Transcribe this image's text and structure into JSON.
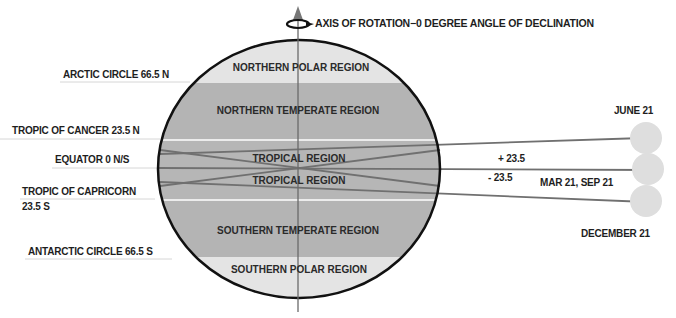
{
  "title": "AXIS OF ROTATION−0 DEGREE ANGLE OF DECLINATION",
  "icons": {
    "rotation": "rotation-arrow-icon"
  },
  "latitude_labels": {
    "arctic": "ARCTIC CIRCLE 66.5 N",
    "cancer": "TROPIC OF CANCER 23.5 N",
    "equator": "EQUATOR 0 N/S",
    "capricorn_line1": "TROPIC OF CAPRICORN",
    "capricorn_line2": "23.5  S",
    "antarctic": "ANTARCTIC CIRCLE 66.5 S"
  },
  "regions": {
    "northern_polar": "NORTHERN POLAR REGION",
    "northern_temperate": "NORTHERN TEMPERATE REGION",
    "tropical_north": "TROPICAL REGION",
    "tropical_south": "TROPICAL REGION",
    "southern_temperate": "SOUTHERN TEMPERATE REGION",
    "southern_polar": "SOUTHERN POLAR REGION"
  },
  "sun_positions": {
    "june": "JUNE 21",
    "equinox": "MAR 21, SEP 21",
    "december": "DECEMBER 21"
  },
  "angles": {
    "plus": "+ 23.5",
    "minus": "- 23.5"
  },
  "colors": {
    "polar": "#e4e4e4",
    "temperate": "#b4b4b4",
    "tropical": "#b4b4b4",
    "band_divider": "#e8e8e8",
    "outline": "#111111",
    "ray": "#6e6e6e",
    "sun": "#dcdcdc"
  }
}
